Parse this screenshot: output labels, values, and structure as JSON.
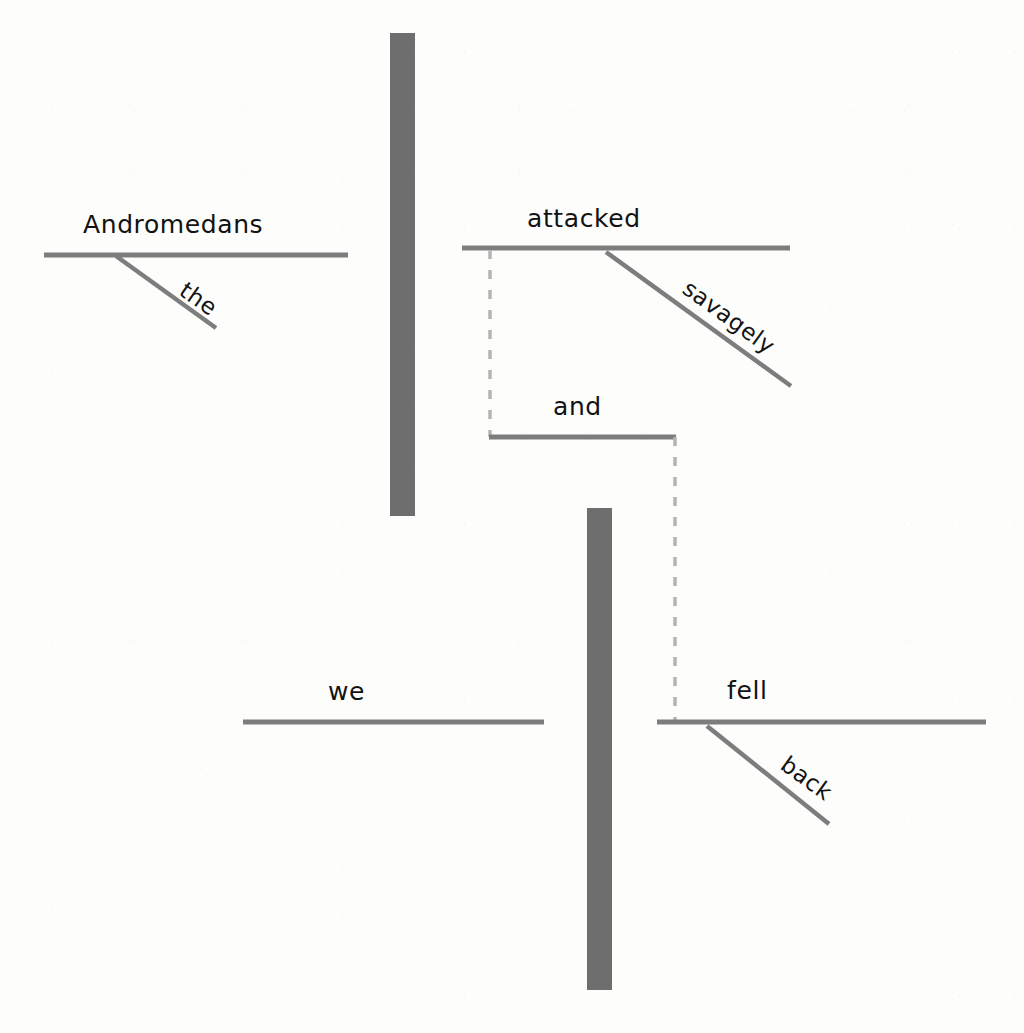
{
  "diagram": {
    "type": "reed-kellogg-sentence-diagram",
    "sentence": "The Andromedans attacked savagely and we fell back.",
    "colors": {
      "line": "#7d7d7d",
      "bar": "#6e6e6e",
      "dashed": "#b4b4b4",
      "text": "#121212",
      "background": "#fdfdfb"
    },
    "clauses": [
      {
        "id": "clause-one",
        "subject": "Andromedans",
        "verb": "attacked",
        "modifiers": [
          "the",
          "savagely"
        ]
      },
      {
        "id": "clause-two",
        "subject": "we",
        "verb": "fell",
        "modifiers": [
          "back"
        ]
      }
    ],
    "conjunction": "and",
    "words": {
      "andromedans": "Andromedans",
      "the": "the",
      "attacked": "attacked",
      "savagely": "savagely",
      "and": "and",
      "we": "we",
      "fell": "fell",
      "back": "back"
    }
  }
}
